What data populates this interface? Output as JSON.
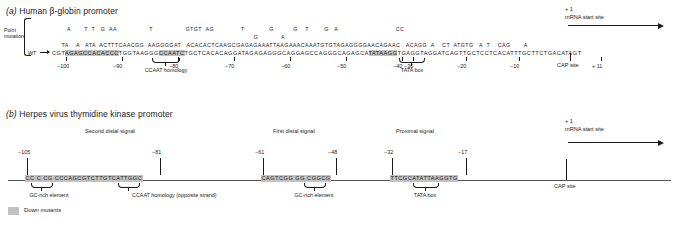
{
  "figure": {
    "legend": {
      "swatch_color": "#c2c2c2",
      "label": "Down mutants"
    }
  },
  "panel_a": {
    "label": "(a)",
    "title": "Human β-globin promoter",
    "point_mutation_label": "Point\nmutation",
    "wt_label": "WT",
    "mutation_rows": [
      "        A       T  T   G  AA                 T                 GTGT  AG              T             G          G    T        G   A                              CC",
      "     TA    A   ATA  ACTTTCAACGG  AAGGGGAT   ACACACTCAAGCGAGAGAAATTAAGAAACAAATGTGTAGAGGGGAACAGAAC   ACAGG  A    CT  ATGTG   A  T    CAG       A"
    ],
    "wt_sequence": "CGTAGAGCCACACCCTGGTAAGGGCCAATCTGCTCACACAGGATAGAGAGGGCAGGAGCCAGGGCAGAGCATATAAGGTGAGGTAGGATCAGTTGCTCCTCACATTTGCTTCTGACATAGT",
    "highlights": [
      {
        "name": "gc-rich-upstream",
        "seq": "AGAGCCACACCC"
      },
      {
        "name": "ccaat-homology",
        "seq": "CCAATC"
      },
      {
        "name": "tata-box",
        "seq": "TATAAGG"
      }
    ],
    "coordinates": [
      "−100",
      "−90",
      "−80",
      "−70",
      "−60",
      "−50",
      "−40",
      "−30",
      "−20",
      "−10",
      "+ 11"
    ],
    "motifs": [
      {
        "name": "ccaat-homology",
        "label": "CCAAT homology"
      },
      {
        "name": "tata-box",
        "label": "TATA box"
      }
    ],
    "cap_site_label": "CAP site",
    "start_site": {
      "plus_one": "+ 1",
      "text": "mRNA start site"
    }
  },
  "panel_b": {
    "label": "(b)",
    "title": "Herpes virus thymidine kinase promoter",
    "signals": [
      {
        "name": "second-distal-signal",
        "label": "Second distal signal",
        "sequence": "CC C CG CCCAGCGTCTTGTCATTGGC",
        "left_coord": "−105",
        "right_coord": "−81"
      },
      {
        "name": "first-distal-signal",
        "label": "First distal signal",
        "sequence": "CAGTCGG GG CGGCG",
        "left_coord": "−61",
        "right_coord": "−48"
      },
      {
        "name": "proximal-signal",
        "label": "Proximal signal",
        "sequence": "TTCGCATATTAAGGTG",
        "left_coord": "−32",
        "right_coord": "−17"
      }
    ],
    "motifs": [
      {
        "name": "gc-rich-element-distal2",
        "label": "GC-rich element"
      },
      {
        "name": "ccaat-homology-opposite-strand",
        "label": "CCAAT homology (opposite strand)"
      },
      {
        "name": "gc-rich-element-distal1",
        "label": "GC-rich element"
      },
      {
        "name": "tata-box",
        "label": "TATA box"
      }
    ],
    "cap_site_label": "CAP site",
    "start_site": {
      "plus_one": "+ 1",
      "text": "mRNA start site"
    }
  }
}
